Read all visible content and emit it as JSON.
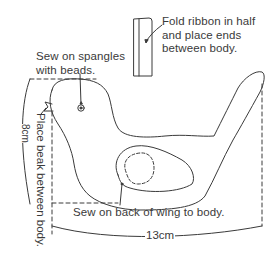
{
  "diagram": {
    "title": "",
    "annotations": {
      "spangles": "Sew on spangles\nwith beads.",
      "ribbon": "Fold ribbon in half\nand place ends\nbetween body.",
      "beak": "Place beak between body.",
      "wing": "Sew on back of wing to body."
    },
    "dimensions": {
      "width": "13cm",
      "height": "8cm"
    },
    "colors": {
      "line": "#3a3a3a",
      "background": "#ffffff"
    }
  }
}
